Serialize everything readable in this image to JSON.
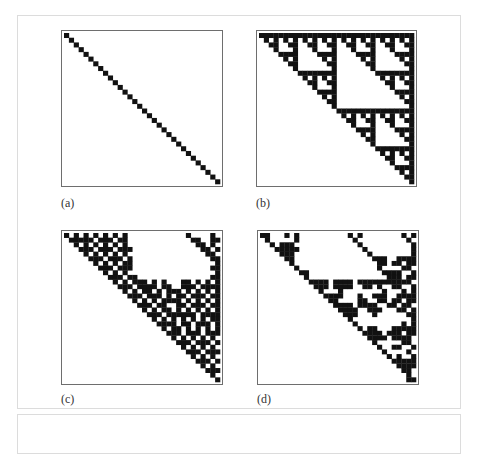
{
  "figure": {
    "grid_size": 32,
    "cell_color": "#111111",
    "panels": [
      {
        "id": "a",
        "label": "(a)",
        "description": "identity matrix (diagonal)",
        "rows": [
          "10000000000000000000000000000000",
          "01000000000000000000000000000000",
          "00100000000000000000000000000000",
          "00010000000000000000000000000000",
          "00001000000000000000000000000000",
          "00000100000000000000000000000000",
          "00000010000000000000000000000000",
          "00000001000000000000000000000000",
          "00000000100000000000000000000000",
          "00000000010000000000000000000000",
          "00000000001000000000000000000000",
          "00000000000100000000000000000000",
          "00000000000010000000000000000000",
          "00000000000001000000000000000000",
          "00000000000000100000000000000000",
          "00000000000000010000000000000000",
          "00000000000000001000000000000000",
          "00000000000000000100000000000000",
          "00000000000000000010000000000000",
          "00000000000000000001000000000000",
          "00000000000000000000100000000000",
          "00000000000000000000010000000000",
          "00000000000000000000001000000000",
          "00000000000000000000000100000000",
          "00000000000000000000000010000000",
          "00000000000000000000000001000000",
          "00000000000000000000000000100000",
          "00000000000000000000000000010000",
          "00000000000000000000000000001000",
          "00000000000000000000000000000100",
          "00000000000000000000000000000010",
          "00000000000000000000000000000001"
        ]
      },
      {
        "id": "b",
        "label": "(b)",
        "description": "Pascal triangle mod 2 (Sierpinski), upper triangular",
        "rows": [
          "11111111111111111111111111111111",
          "01010101010101010101010101010101",
          "00110011001100110011001100110011",
          "00010001000100010001000100010001",
          "00001111000011110000111100001111",
          "00000101000001010000010100000101",
          "00000011000000110000001100000011",
          "00000001000000010000000100000001",
          "00000000111111110000000011111111",
          "00000000010101010000000001010101",
          "00000000001100110000000000110011",
          "00000000000100010000000000010001",
          "00000000000011110000000000001111",
          "00000000000001010000000000000101",
          "00000000000000110000000000000011",
          "00000000000000010000000000000001",
          "00000000000000001111111111111111",
          "00000000000000000101010101010101",
          "00000000000000000011001100110011",
          "00000000000000000001000100010001",
          "00000000000000000000111100001111",
          "00000000000000000000010100000101",
          "00000000000000000000001100000011",
          "00000000000000000000000100000001",
          "00000000000000000000000011111111",
          "00000000000000000000000001010101",
          "00000000000000000000000000110011",
          "00000000000000000000000000010001",
          "00000000000000000000000000001111",
          "00000000000000000000000000000101",
          "00000000000000000000000000000011",
          "00000000000000000000000000000001"
        ]
      },
      {
        "id": "c",
        "label": "(c)",
        "description": "upper triangular binary pattern",
        "rows": [
          "10101010101010000000000001000010",
          "01111101110110000000000000110011",
          "00101010101010000000000000011010",
          "00011101110111000000000000001101",
          "00001010101010000000000000000110",
          "00000111011101000000000000000011",
          "00000010101011000000000000000001",
          "00000001110111000000000000000011",
          "00000000101010000000000000000001",
          "00000000011101100000000000000011",
          "00000000001010111010100011010101",
          "00000000000111011110110011101111",
          "00000000000010101101011101010101",
          "00000000000001110111010110111011",
          "00000000000000101010111101010101",
          "00000000000000011101100110111011",
          "00000000000000001010110101010101",
          "00000000000000000111011111101111",
          "00000000000000000010101010101011",
          "00000000000000000001111011011101",
          "00000000000000000000101101010101",
          "00000000000000000000011101110111",
          "00000000000000000000001010101010",
          "00000000000000000000000111011101",
          "00000000000000000000000010101010",
          "00000000000000000000000001110111",
          "00000000000000000000000000101010",
          "00000000000000000000000000011101",
          "00000000000000000000000000001010",
          "00000000000000000000000000000111",
          "00000000000000000000000000000010",
          "00000000000000000000000000000001"
        ]
      },
      {
        "id": "d",
        "label": "(d)",
        "description": "upper triangular binary pattern",
        "rows": [
          "11000101000000000010100000000101",
          "01000001000000000001000000000010",
          "00101110000000000000100000000001",
          "00011111000000000000010000000001",
          "00001110000000000000001000000001",
          "00000110000000000000000111001111",
          "00000010000000000000000011011011",
          "00000001000000000000000010000110",
          "00000000110000000000000001111001",
          "00000000010000000000000000111011",
          "00000000001111011110111111111110",
          "00000000000111011110011010011001",
          "00000000000010001000000001000101",
          "00000000000001111000100111001111",
          "00000000000000110000110011011011",
          "00000000000000011110111100110110",
          "00000000000000001111001110001101",
          "00000000000000000111000100000011",
          "00000000000000000010000000000001",
          "00000000000000000001000000000101",
          "00000000000000000000101100011111",
          "00000000000000000000011110111011",
          "00000000000000000000001111011110",
          "00000000000000000000000100000110",
          "00000000000000000000000010011001",
          "00000000000000000000000001000010",
          "00000000000000000000000000101001",
          "00000000000000000000000000011111",
          "00000000000000000000000000001111",
          "00000000000000000000000000000110",
          "00000000000000000000000000000010",
          "00000000000000000000000000000011"
        ]
      }
    ]
  }
}
